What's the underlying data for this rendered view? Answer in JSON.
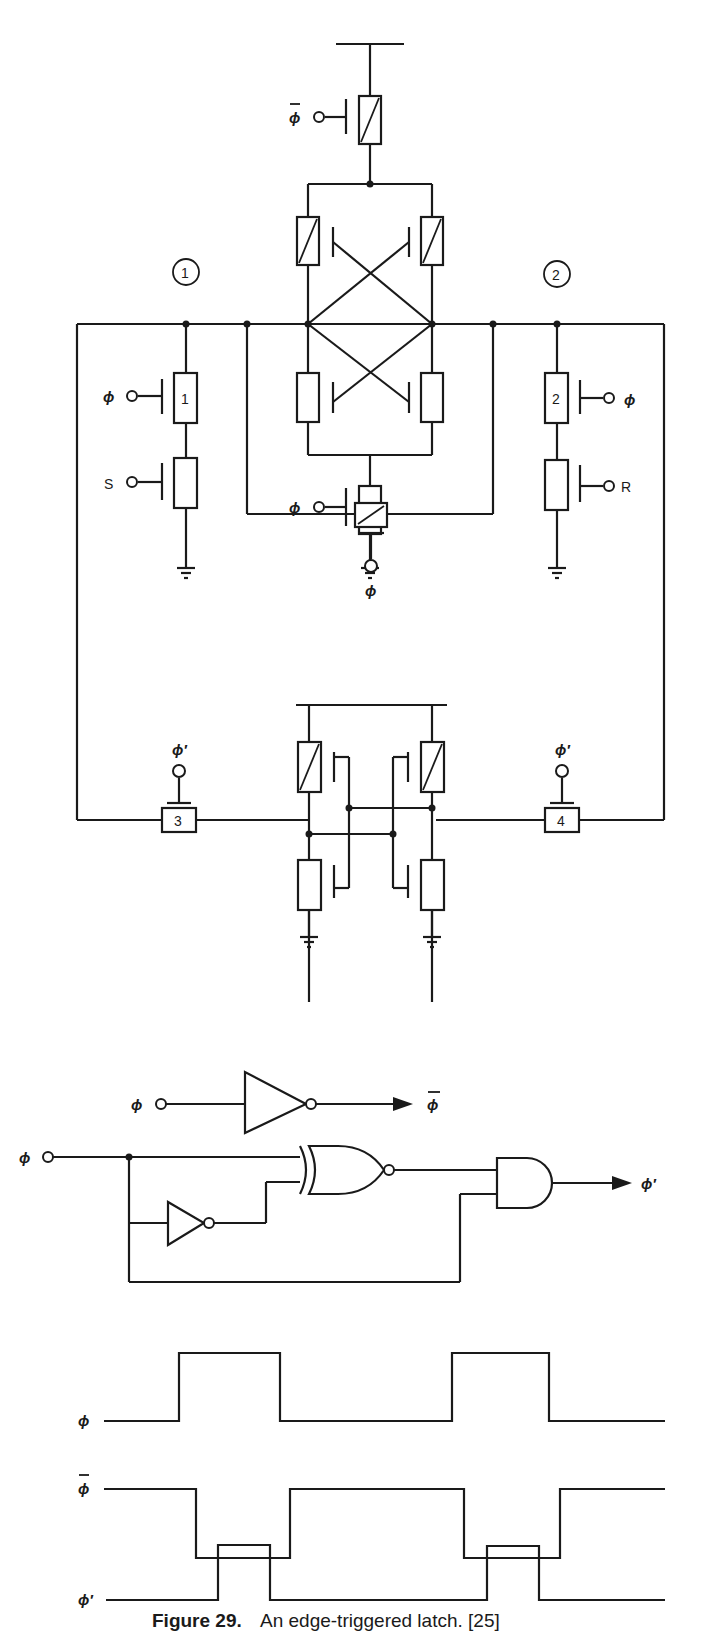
{
  "figure": {
    "number_label": "Figure 29.",
    "caption": "An edge-triggered latch. [25]"
  },
  "latch_circuit": {
    "node_labels": [
      "1",
      "2"
    ],
    "transistor_labels": [
      "1",
      "2",
      "3",
      "4"
    ],
    "inputs": {
      "phi": "ϕ",
      "phi_bar": "ϕ",
      "phi_prime": "ϕ′",
      "set": "S",
      "reset": "R"
    }
  },
  "inverter_circuit": {
    "input": "ϕ",
    "output": "ϕ"
  },
  "pulse_generator": {
    "input": "ϕ",
    "output": "ϕ′",
    "gates": [
      "inverter",
      "XNOR",
      "AND"
    ]
  },
  "timing": {
    "signals": [
      {
        "name": "ϕ",
        "overline": false
      },
      {
        "name": "ϕ",
        "overline": true
      },
      {
        "name": "ϕ′",
        "overline": false
      }
    ]
  }
}
